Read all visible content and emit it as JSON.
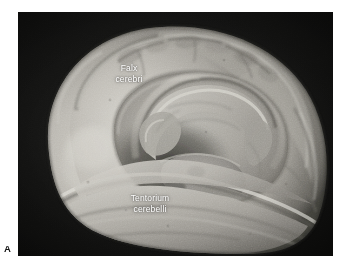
{
  "figure": {
    "panel_letter": "A",
    "caption_labels": [
      {
        "id": "falx",
        "text": "Falx\ncerebri"
      },
      {
        "id": "tentorium",
        "text": "Tentorium\ncerebelli"
      }
    ],
    "label_falx": "Falx\ncerebri",
    "label_tentorium": "Tentorium\ncerebelli",
    "colors": {
      "page_background": "#ffffff",
      "photo_background": "#121212",
      "specimen_light": "#c8c6c0",
      "specimen_mid": "#9a9892",
      "specimen_dark": "#4e4d49",
      "label_text": "#ffffff",
      "panel_letter": "#111111"
    },
    "photo_bounds": {
      "left": 18,
      "top": 12,
      "width": 315,
      "height": 244
    }
  }
}
